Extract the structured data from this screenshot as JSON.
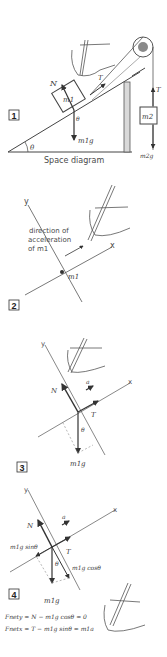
{
  "figure": {
    "panels": [
      {
        "number": "1",
        "caption": "Space diagram",
        "labels": {
          "normal": "N",
          "tension": "T",
          "mass1": "m1",
          "mass2": "m2",
          "angle": "θ",
          "weight1": "m1g",
          "weight2": "m2g",
          "tension2": "T"
        }
      },
      {
        "number": "2",
        "labels": {
          "y_axis": "y",
          "x_axis": "x",
          "point": "m1",
          "annotation_line1": "direction of",
          "annotation_line2": "acceleration",
          "annotation_line3": "of m1"
        }
      },
      {
        "number": "3",
        "labels": {
          "y_axis": "y",
          "x_axis": "x",
          "normal": "N",
          "accel": "a",
          "tension": "T",
          "angle": "θ",
          "weight": "m1g"
        }
      },
      {
        "number": "4",
        "labels": {
          "y_axis": "y",
          "x_axis": "x",
          "normal": "N",
          "accel": "a",
          "tension": "T",
          "angle": "θ",
          "weight": "m1g",
          "parallel": "m1g sinθ",
          "perpendicular": "m1g cosθ"
        },
        "equations": [
          "Fnety = N − m1g cosθ = 0",
          "Fnetx = T − m1g sinθ = m1a"
        ]
      }
    ],
    "colors": {
      "ink": "#3a3a3a",
      "background": "#ffffff",
      "pulley": "#8a8a8a"
    }
  }
}
